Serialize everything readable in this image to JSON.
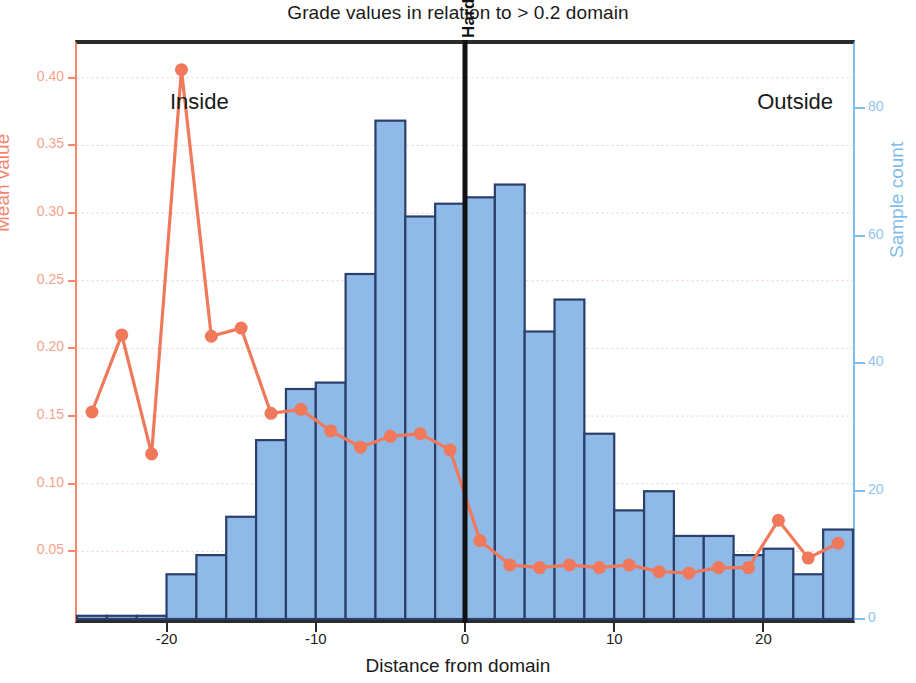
{
  "chart_data": {
    "type": "bar",
    "title": "Grade values in relation to > 0.2 domain",
    "xlabel": "Distance from domain",
    "ylabel": "Mean value",
    "ylabel_secondary": "Sample count",
    "xlim": [
      -26,
      26
    ],
    "ylim": [
      0,
      0.425
    ],
    "ylim_secondary": [
      0,
      90
    ],
    "grid": true,
    "legend": "none",
    "xticks": [
      "-20",
      "-10",
      "0",
      "10",
      "20"
    ],
    "xtick_values": [
      -20,
      -10,
      0,
      10,
      20
    ],
    "yticks_left": [
      "0.05",
      "0.10",
      "0.15",
      "0.20",
      "0.25",
      "0.30",
      "0.35",
      "0.40"
    ],
    "ytick_values_left": [
      0.05,
      0.1,
      0.15,
      0.2,
      0.25,
      0.3,
      0.35,
      0.4
    ],
    "yticks_right": [
      "0",
      "20",
      "40",
      "60",
      "80"
    ],
    "ytick_values_right": [
      0,
      20,
      40,
      60,
      80
    ],
    "annotations": [
      {
        "name": "inside-label",
        "text": "Inside",
        "x": -24,
        "position": "top-left"
      },
      {
        "name": "outside-label",
        "text": "Outside",
        "x": 24,
        "position": "top-right"
      },
      {
        "name": "hard-boundary-label",
        "text": "Hard boundary",
        "x": 0,
        "rotation": 90
      }
    ],
    "boundary_line": {
      "x": 0,
      "color": "#111111",
      "label": "Hard boundary"
    },
    "series": [
      {
        "name": "Sample count",
        "type": "bar",
        "axis": "right",
        "color": "#8fb9e6",
        "edge_color": "#2a3f6b",
        "bin_width": 2,
        "x": [
          -25,
          -23,
          -21,
          -19,
          -17,
          -15,
          -13,
          -11,
          -9,
          -7,
          -5,
          -3,
          -1,
          1,
          3,
          5,
          7,
          9,
          11,
          13,
          15,
          17,
          19,
          21,
          23,
          25
        ],
        "values": [
          0.5,
          0.5,
          0.5,
          7,
          10,
          16,
          28,
          36,
          37,
          54,
          78,
          63,
          65,
          66,
          68,
          45,
          50,
          29,
          17,
          20,
          13,
          13,
          10,
          11,
          7,
          14
        ]
      },
      {
        "name": "Mean value",
        "type": "line",
        "axis": "left",
        "color": "#f0795c",
        "marker": "circle",
        "x": [
          -25,
          -23,
          -21,
          -19,
          -17,
          -15,
          -13,
          -11,
          -9,
          -7,
          -5,
          -3,
          -1,
          1,
          3,
          5,
          7,
          9,
          11,
          13,
          15,
          17,
          19,
          21,
          23,
          25
        ],
        "values": [
          0.153,
          0.21,
          0.122,
          0.406,
          0.209,
          0.215,
          0.152,
          0.155,
          0.139,
          0.127,
          0.135,
          0.137,
          0.125,
          0.058,
          0.04,
          0.038,
          0.04,
          0.038,
          0.04,
          0.035,
          0.034,
          0.038,
          0.038,
          0.073,
          0.045,
          0.056
        ]
      }
    ]
  },
  "colors": {
    "bar_fill": "#8fb9e6",
    "bar_edge": "#2a3f6b",
    "line": "#f0795c",
    "left_axis": "#f4866b",
    "right_axis": "#7fbde8",
    "frame": "#2b2b2b"
  }
}
